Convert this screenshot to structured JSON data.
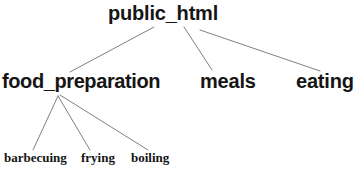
{
  "diagram": {
    "type": "tree",
    "background_color": "#ffffff",
    "edge_color": "#808080",
    "text_color": "#151515",
    "nodes": {
      "root": {
        "label": "public_html",
        "level": 1
      },
      "food_preparation": {
        "label": "food_preparation",
        "level": 2
      },
      "meals": {
        "label": "meals",
        "level": 2
      },
      "eating": {
        "label": "eating",
        "level": 2
      },
      "barbecuing": {
        "label": "barbecuing",
        "level": 3
      },
      "frying": {
        "label": "frying",
        "level": 3
      },
      "boiling": {
        "label": "boiling",
        "level": 3
      }
    },
    "edges": [
      {
        "from": "root",
        "to": "food_preparation",
        "x1": 154,
        "y1": 27,
        "x2": 70,
        "y2": 72
      },
      {
        "from": "root",
        "to": "meals",
        "x1": 184,
        "y1": 27,
        "x2": 212,
        "y2": 70
      },
      {
        "from": "root",
        "to": "eating",
        "x1": 200,
        "y1": 30,
        "x2": 320,
        "y2": 71
      },
      {
        "from": "food_preparation",
        "to": "barbecuing",
        "x1": 58,
        "y1": 96,
        "x2": 33,
        "y2": 150
      },
      {
        "from": "food_preparation",
        "to": "frying",
        "x1": 58,
        "y1": 96,
        "x2": 90,
        "y2": 150
      },
      {
        "from": "food_preparation",
        "to": "boiling",
        "x1": 60,
        "y1": 95,
        "x2": 148,
        "y2": 150
      }
    ]
  }
}
